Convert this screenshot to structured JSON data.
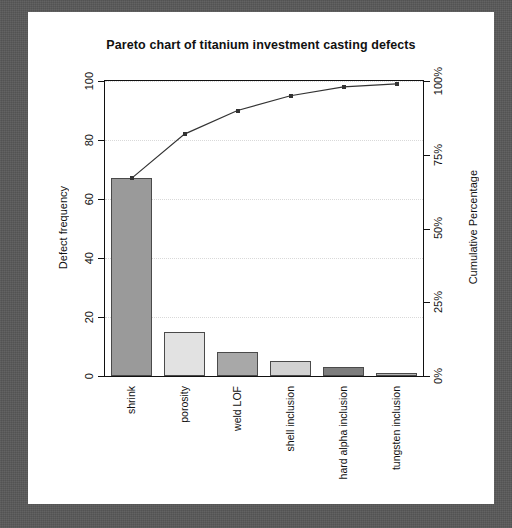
{
  "chart_data": {
    "type": "bar",
    "title": "Pareto chart of titanium investment casting defects",
    "xlabel": "",
    "ylabel": "Defect frequency",
    "y2label": "Cumulative Percentage",
    "categories": [
      "shrink",
      "porosity",
      "weld LOF",
      "shell inclusion",
      "hard alpha inclusion",
      "tungsten inclusion"
    ],
    "values": [
      67,
      15,
      8,
      5,
      3,
      1
    ],
    "bar_colors": [
      "#9a9a9a",
      "#e2e2e2",
      "#a8a8a8",
      "#d2d2d2",
      "#7d7d7d",
      "#b5b5b5"
    ],
    "cumulative_values": [
      67,
      82,
      90,
      95,
      98,
      99
    ],
    "cumulative_percent": [
      "67.7%",
      "82.8%",
      "90.9%",
      "96.0%",
      "99.0%",
      "100.0%"
    ],
    "ylim": [
      0,
      100
    ],
    "yticks": [
      "0",
      "20",
      "40",
      "60",
      "80",
      "100"
    ],
    "ytick_values": [
      0,
      20,
      40,
      60,
      80,
      100
    ],
    "y2lim": [
      0,
      100
    ],
    "y2ticks": [
      "0%",
      "25%",
      "50%",
      "75%",
      "100%"
    ],
    "y2tick_values": [
      0,
      25,
      50,
      75,
      100
    ],
    "grid": true,
    "legend": "none",
    "line_color": "#333333",
    "marker": "square"
  },
  "figure": {
    "background_color": "#585858",
    "panel_color": "#ffffff"
  }
}
